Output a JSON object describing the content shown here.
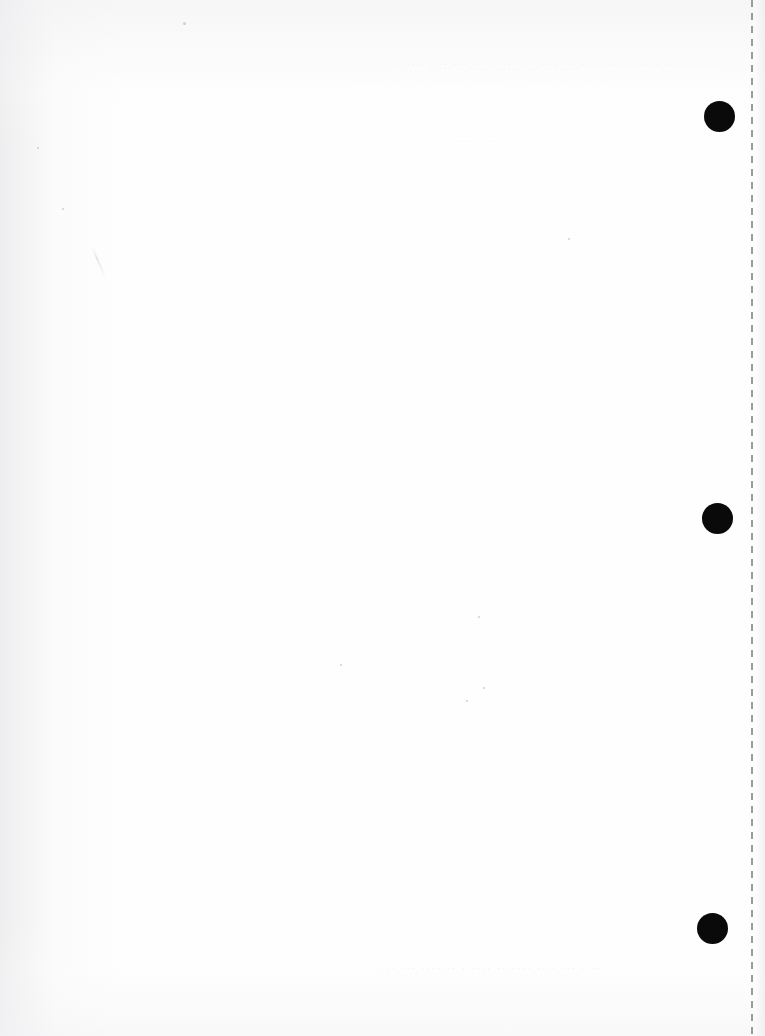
{
  "document": {
    "title": "Scanned blank page",
    "page_width": 765,
    "page_height": 1036,
    "background_color": "#ffffff",
    "paper_tint": "#fefefe",
    "content_text": ""
  },
  "marks": {
    "punch_marks": [
      {
        "name": "punch-mark-top",
        "cx": 719,
        "cy": 116,
        "diameter": 31,
        "color": "#0a0a0a"
      },
      {
        "name": "punch-mark-middle",
        "cx": 717,
        "cy": 518,
        "diameter": 31,
        "color": "#0a0a0a"
      },
      {
        "name": "punch-mark-bottom",
        "cx": 712,
        "cy": 928,
        "diameter": 31,
        "color": "#0a0a0a"
      }
    ],
    "cut_line": {
      "name": "dashed-cut-line",
      "x": 751,
      "orientation": "vertical",
      "dash_length": 7,
      "gap_length": 6,
      "stroke_width": 2,
      "color": "#9a9a9f"
    }
  },
  "artifacts": {
    "ghost_text": {
      "note": "Reverse-side bleed-through; illegible in the scan",
      "top_line_1": "· · ·· ·· ·· ···· ·· ···· · ·· ··· ···· · ·· ··· ·· ·· ··· ·· · ···· ·",
      "top_line_2": "·· ··· · ··· ··· · · ·· ··· ·· ···· ·· · ·· ··· ···",
      "top_line_3": "·· ·· ··· ··· ···· ·· ··· ·· ·· ···· ·",
      "mid_line_1": "· ··· ·· ···· ·· ·",
      "mid_line_2": "·· ·· ·· ···",
      "bottom_line_1": "·· · ··· · ·· ···· ·· ···· · ·· ···· ··· ·· ·",
      "bottom_line_2": "··· ···· ·· ··· ··· ·· ·· ·"
    },
    "specks": [
      {
        "name": "speck-top-left",
        "x": 183,
        "y": 22,
        "size": 3
      },
      {
        "name": "speck-left-upper",
        "x": 37,
        "y": 147,
        "size": 2
      },
      {
        "name": "speck-mid-left",
        "x": 62,
        "y": 208,
        "size": 2
      },
      {
        "name": "speck-center",
        "x": 478,
        "y": 616,
        "size": 2
      },
      {
        "name": "speck-center-low",
        "x": 483,
        "y": 687,
        "size": 2
      },
      {
        "name": "speck-lower-left",
        "x": 466,
        "y": 700,
        "size": 2
      },
      {
        "name": "speck-right-mid",
        "x": 568,
        "y": 238,
        "size": 2
      },
      {
        "name": "speck-bottom-mid",
        "x": 340,
        "y": 664,
        "size": 2
      }
    ],
    "scratch": {
      "name": "paper-scratch",
      "x": 98,
      "y": 246,
      "length": 34,
      "angle": -24
    }
  }
}
